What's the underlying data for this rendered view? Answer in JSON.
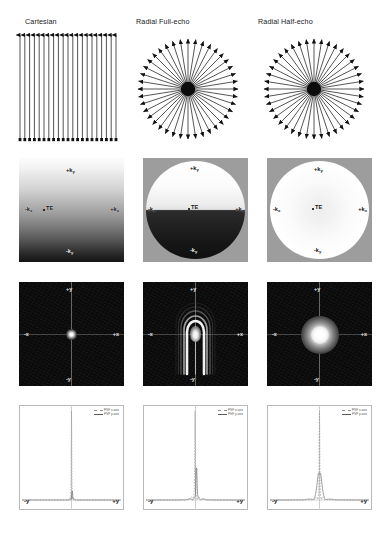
{
  "figure": {
    "columns": [
      {
        "id": "cartesian",
        "title": "Cartesian"
      },
      {
        "id": "full_echo",
        "title": "Radial Full-echo"
      },
      {
        "id": "half_echo",
        "title": "Radial Half-echo"
      }
    ],
    "rows": [
      {
        "id": "trajectory",
        "name": "k-space trajectory diagram"
      },
      {
        "id": "kspace",
        "name": "k-space magnitude"
      },
      {
        "id": "psf",
        "name": "point spread function"
      },
      {
        "id": "profile",
        "name": "point spread function profile"
      }
    ]
  },
  "trajectory": {
    "cartesian": {
      "type": "parallel-lines",
      "line_count": 21,
      "arrow_ends": "both",
      "direction": "vertical"
    },
    "full_echo": {
      "type": "radial-spokes",
      "spoke_count": 40,
      "arrow_ends": "outer",
      "hub": "filled"
    },
    "half_echo": {
      "type": "radial-spokes",
      "spoke_count": 40,
      "arrow_ends": "outer",
      "hub": "filled"
    }
  },
  "kspace": {
    "cartesian": {
      "shape": "square",
      "labels": {
        "top": "+k",
        "top_sub": "y",
        "left": "-k",
        "left_sub": "x",
        "right": "+k",
        "right_sub": "x",
        "bottom": "-k",
        "bottom_sub": "y",
        "center": "TE"
      },
      "te_position": "left-of-center",
      "gradient": "bright-top to dark-bottom"
    },
    "full_echo": {
      "shape": "circle",
      "labels": {
        "top": "+k",
        "top_sub": "y",
        "left": "-k",
        "left_sub": "x",
        "right": "+k",
        "right_sub": "x",
        "bottom": "-k",
        "bottom_sub": "y",
        "center": "TE"
      },
      "te_position": "center",
      "gradient": "bright-upper-half, dark-lower-half"
    },
    "half_echo": {
      "shape": "circle",
      "labels": {
        "top": "+k",
        "top_sub": "y",
        "left": "-k",
        "left_sub": "x",
        "right": "+k",
        "right_sub": "x",
        "bottom": "-k",
        "bottom_sub": "y",
        "center": "TE"
      },
      "te_position": "center",
      "gradient": "uniform bright disc"
    }
  },
  "psf": {
    "axis_labels": {
      "top": "+y",
      "bottom": "-y",
      "left": "-x",
      "right": "+x"
    },
    "cartesian": {
      "shape": "compact-point",
      "width": 6,
      "height": 6,
      "artifact": "none"
    },
    "full_echo": {
      "shape": "arc-streak",
      "width": 16,
      "height": 34,
      "artifact": "parabolic ringing arcs"
    },
    "half_echo": {
      "shape": "broad-blob",
      "width": 24,
      "height": 24,
      "artifact": "radial halo"
    }
  },
  "chart_data": [
    {
      "id": "profile-cartesian",
      "type": "line",
      "title": "Cartesian PSF profile",
      "xlabel": "",
      "ylabel": "",
      "xtick_labels": [
        "-y",
        "+y"
      ],
      "xlim": [
        -1,
        1
      ],
      "ylim": [
        0,
        1
      ],
      "grid": false,
      "legend_position": "top-right",
      "series": [
        {
          "name": "PSF x-axis",
          "style": "dashed",
          "color": "#8c8c8c",
          "peak_height": 1.0,
          "peak_x": 0.0,
          "fwhm": 0.012,
          "tail": 0.02
        },
        {
          "name": "PSF y-axis",
          "style": "solid",
          "color": "#5a5a5a",
          "peak_height": 0.1,
          "peak_x": 0.015,
          "fwhm": 0.02,
          "tail": 0.03
        }
      ]
    },
    {
      "id": "profile-full-echo",
      "type": "line",
      "title": "Radial Full-echo PSF profile",
      "xlabel": "",
      "ylabel": "",
      "xtick_labels": [
        "-y",
        "+y"
      ],
      "xlim": [
        -1,
        1
      ],
      "ylim": [
        0,
        1
      ],
      "grid": false,
      "legend_position": "top-right",
      "series": [
        {
          "name": "PSF x-axis",
          "style": "dashed",
          "color": "#8c8c8c",
          "peak_height": 1.0,
          "peak_x": -0.01,
          "fwhm": 0.012,
          "tail": 0.05
        },
        {
          "name": "PSF y-axis",
          "style": "solid",
          "color": "#5a5a5a",
          "peak_height": 0.36,
          "peak_x": 0.02,
          "fwhm": 0.022,
          "tail": 0.09
        }
      ]
    },
    {
      "id": "profile-half-echo",
      "type": "line",
      "title": "Radial Half-echo PSF profile",
      "xlabel": "",
      "ylabel": "",
      "xtick_labels": [
        "-y",
        "+y"
      ],
      "xlim": [
        -1,
        1
      ],
      "ylim": [
        0,
        1
      ],
      "grid": false,
      "legend_position": "top-right",
      "series": [
        {
          "name": "PSF x-axis",
          "style": "dashed",
          "color": "#8c8c8c",
          "peak_height": 1.0,
          "peak_x": 0.0,
          "fwhm": 0.012,
          "tail": 0.04
        },
        {
          "name": "PSF y-axis",
          "style": "solid",
          "color": "#5a5a5a",
          "peak_height": 0.3,
          "peak_x": 0.0,
          "fwhm": 0.1,
          "tail": 0.14
        }
      ]
    }
  ]
}
